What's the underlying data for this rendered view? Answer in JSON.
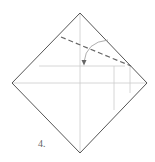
{
  "diagram": {
    "step_label": "4.",
    "colors": {
      "outline": "#555555",
      "crease": "#cccccc",
      "dashed": "#666666",
      "arrow": "#888888",
      "label": "#666666"
    },
    "paper": {
      "shape": "diamond",
      "top": [
        80,
        13
      ],
      "right": [
        147,
        83
      ],
      "bottom": [
        80,
        153
      ],
      "left": [
        12,
        83
      ]
    },
    "creases": [
      {
        "name": "vertical-center",
        "from": [
          80,
          13
        ],
        "to": [
          80,
          153
        ]
      },
      {
        "name": "horizontal-center",
        "from": [
          12,
          83
        ],
        "to": [
          147,
          83
        ]
      },
      {
        "name": "horizontal-upper",
        "from": [
          39,
          66
        ],
        "to": [
          125,
          66
        ]
      },
      {
        "name": "vertical-right-inner",
        "from": [
          114,
          66
        ],
        "to": [
          114,
          110
        ]
      },
      {
        "name": "vertical-right-outer",
        "from": [
          130,
          66
        ],
        "to": [
          130,
          93
        ]
      }
    ],
    "valley_fold_line": {
      "from": [
        61,
        37
      ],
      "to": [
        131,
        66
      ],
      "style": "dashed"
    },
    "fold_arrow": {
      "from": [
        108,
        40
      ],
      "to": [
        84,
        64
      ],
      "direction": "down-left"
    }
  }
}
